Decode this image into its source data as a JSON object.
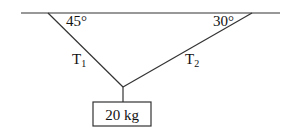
{
  "diagram": {
    "angle_left": "45°",
    "angle_right": "30°",
    "tension_left": {
      "symbol": "T",
      "subscript": "1"
    },
    "tension_right": {
      "symbol": "T",
      "subscript": "2"
    },
    "mass_label": "20 kg"
  }
}
